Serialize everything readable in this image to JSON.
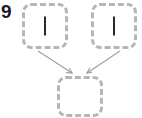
{
  "figure": {
    "label": "9",
    "background_color": "#ffffff"
  },
  "diagram": {
    "type": "flow-diagram",
    "node_border_color": "#b6b6b6",
    "node_fill_color": "#ffffff",
    "node_border_style": "dashed",
    "bar_color": "#2a2a2a",
    "edge_color": "#9e9e9e",
    "nodes": [
      {
        "id": "top-left",
        "label": "",
        "glyph": "vertical-bar",
        "x": 22,
        "y": 3,
        "width": 46,
        "height": 46
      },
      {
        "id": "top-right",
        "label": "",
        "glyph": "vertical-bar",
        "x": 91,
        "y": 3,
        "width": 46,
        "height": 46
      },
      {
        "id": "bottom",
        "label": "",
        "glyph": "",
        "x": 57,
        "y": 76,
        "width": 46,
        "height": 41
      }
    ],
    "edges": [
      {
        "id": "edge-top-left-to-bottom",
        "from": "top-left",
        "to": "bottom",
        "arrowhead": true
      },
      {
        "id": "edge-top-right-to-bottom",
        "from": "top-right",
        "to": "bottom",
        "arrowhead": true
      }
    ]
  }
}
